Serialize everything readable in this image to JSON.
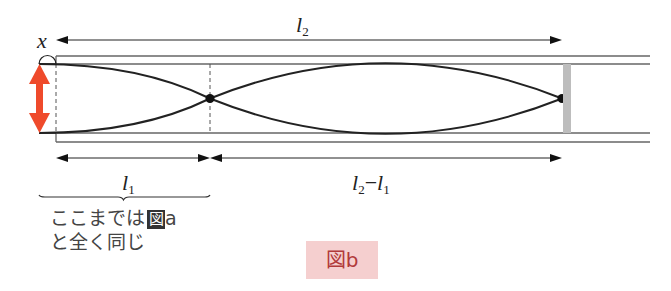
{
  "figure": {
    "caption": "図b",
    "caption_bg_color": "#f5cfcf",
    "caption_text_color": "#b13a3a",
    "labels": {
      "x": "x",
      "l2_main": "l",
      "l2_sub": "2",
      "l1_main": "l",
      "l1_sub": "1",
      "diff_a_main": "l",
      "diff_a_sub": "2",
      "diff_minus": "−",
      "diff_b_main": "l",
      "diff_b_sub": "1"
    },
    "note": {
      "line1": "ここまでは",
      "fig_ref_box": "図",
      "fig_ref_letter": "a",
      "line2": "と全く同じ"
    },
    "colors": {
      "arrow_red": "#ef4a2b",
      "line": "#222222",
      "tube": "#555555",
      "piston": "#bdbdbd"
    }
  }
}
